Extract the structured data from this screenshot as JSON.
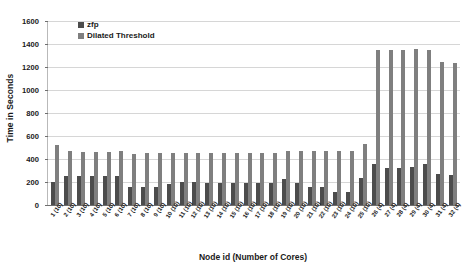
{
  "chart_data": {
    "type": "bar",
    "title": "",
    "xlabel": "Node id (Number of Cores)",
    "ylabel": "Time in Seconds",
    "ylim": [
      0,
      1600
    ],
    "yticks": [
      0,
      200,
      400,
      600,
      800,
      1000,
      1200,
      1400,
      1600
    ],
    "grid": true,
    "legend_position": "top-left",
    "categories": [
      "1 (10)",
      "2 (10)",
      "3 (10)",
      "4 (10)",
      "5 (10)",
      "6 (10)",
      "7 (10)",
      "8 (10)",
      "9 (10)",
      "10 (10)",
      "11 (10)",
      "12 (10)",
      "13 (10)",
      "14 (10)",
      "15 (10)",
      "16 (10)",
      "17 (10)",
      "18 (10)",
      "19 (10)",
      "20 (10)",
      "21 (10)",
      "22 (10)",
      "23 (10)",
      "24 (10)",
      "25 (10)",
      "26 (4)",
      "27 (4)",
      "28 (4)",
      "29 (4)",
      "30 (4)",
      "31 (4)",
      "32 (4)"
    ],
    "series": [
      {
        "name": "zfp",
        "color": "#4c4c4c",
        "values": [
          200,
          250,
          250,
          250,
          250,
          250,
          160,
          160,
          160,
          180,
          200,
          200,
          195,
          195,
          195,
          195,
          195,
          195,
          230,
          190,
          160,
          155,
          115,
          115,
          235,
          355,
          320,
          320,
          330,
          355,
          270,
          260
        ]
      },
      {
        "name": "Dilated Threshold",
        "color": "#7f7f7f",
        "values": [
          520,
          470,
          465,
          465,
          465,
          470,
          445,
          450,
          450,
          450,
          455,
          455,
          450,
          450,
          450,
          450,
          455,
          450,
          470,
          470,
          470,
          470,
          470,
          470,
          530,
          1350,
          1350,
          1350,
          1355,
          1350,
          1240,
          1235
        ]
      }
    ]
  },
  "legend": {
    "items": [
      {
        "label": "zfp",
        "color": "#4c4c4c"
      },
      {
        "label": "Dilated Threshold",
        "color": "#7f7f7f"
      }
    ]
  },
  "axes": {
    "y_title": "Time in Seconds",
    "x_title": "Node id (Number of Cores)"
  }
}
